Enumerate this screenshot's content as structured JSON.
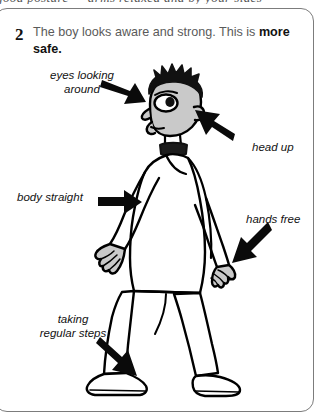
{
  "page": {
    "cropped_top_line": "good posture — arms relaxed and by your sides",
    "background_color": "#ffffff",
    "frame_color": "#7c7c7c"
  },
  "caption": {
    "number": "2",
    "text_plain": "The boy looks aware and strong. This is more safe.",
    "text_html": "The boy looks aware and strong. This is <b>more safe.</b>",
    "emphasis": "more safe.",
    "text_color": "#5a5a5a",
    "emphasis_color": "#111111"
  },
  "annotations": [
    {
      "id": "eyes-looking-around",
      "label": "eyes looking\naround",
      "arrow_direction": "down-right",
      "points_to": "head-eyes"
    },
    {
      "id": "head-up",
      "label": "head up",
      "arrow_direction": "up-left",
      "points_to": "head"
    },
    {
      "id": "body-straight",
      "label": "body straight",
      "arrow_direction": "right",
      "points_to": "torso"
    },
    {
      "id": "hands-free",
      "label": "hands free",
      "arrow_direction": "down-left",
      "points_to": "right-hand"
    },
    {
      "id": "taking-regular-steps",
      "label": "taking\nregular steps",
      "arrow_direction": "down-right",
      "points_to": "feet"
    }
  ],
  "illustration": {
    "subject": "boy walking with good posture",
    "line_color": "#000000",
    "skin_fill": "#c9c9c9",
    "hair_fill": "#000000",
    "shirt_fill": "#ffffff",
    "trousers_fill": "#ffffff",
    "arrow_fill": "#000000"
  }
}
